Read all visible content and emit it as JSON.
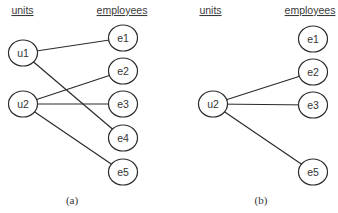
{
  "colors": {
    "stroke": "#2b2b2b",
    "text": "#333333",
    "background": "#ffffff"
  },
  "panels": [
    {
      "id": "a",
      "caption": "(a)",
      "caption_pos": [
        72,
        204
      ],
      "headers": {
        "units": {
          "label": "units",
          "x": 22.5,
          "y": 14
        },
        "employees": {
          "label": "employees",
          "x": 122,
          "y": 14
        }
      },
      "nodes": [
        {
          "id": "u1",
          "label": "u1",
          "type": "unit",
          "x": 23,
          "y": 53
        },
        {
          "id": "u2",
          "label": "u2",
          "type": "unit",
          "x": 23,
          "y": 104
        },
        {
          "id": "e1",
          "label": "e1",
          "type": "employee",
          "x": 123,
          "y": 38
        },
        {
          "id": "e2",
          "label": "e2",
          "type": "employee",
          "x": 123,
          "y": 71
        },
        {
          "id": "e3",
          "label": "e3",
          "type": "employee",
          "x": 123,
          "y": 104
        },
        {
          "id": "e4",
          "label": "e4",
          "type": "employee",
          "x": 123,
          "y": 138
        },
        {
          "id": "e5",
          "label": "e5",
          "type": "employee",
          "x": 123,
          "y": 172
        }
      ],
      "edges": [
        [
          "u1",
          "e1"
        ],
        [
          "u1",
          "e4"
        ],
        [
          "u2",
          "e2"
        ],
        [
          "u2",
          "e3"
        ],
        [
          "u2",
          "e5"
        ]
      ]
    },
    {
      "id": "b",
      "caption": "(b)",
      "caption_pos": [
        261,
        204
      ],
      "headers": {
        "units": {
          "label": "units",
          "x": 210.5,
          "y": 14
        },
        "employees": {
          "label": "employees",
          "x": 310,
          "y": 14
        }
      },
      "nodes": [
        {
          "id": "u2",
          "label": "u2",
          "type": "unit",
          "x": 213,
          "y": 104
        },
        {
          "id": "e1",
          "label": "e1",
          "type": "employee",
          "x": 313,
          "y": 39
        },
        {
          "id": "e2",
          "label": "e2",
          "type": "employee",
          "x": 313,
          "y": 72
        },
        {
          "id": "e3",
          "label": "e3",
          "type": "employee",
          "x": 313,
          "y": 105
        },
        {
          "id": "e5",
          "label": "e5",
          "type": "employee",
          "x": 313,
          "y": 172
        }
      ],
      "edges": [
        [
          "u2",
          "e2"
        ],
        [
          "u2",
          "e3"
        ],
        [
          "u2",
          "e5"
        ]
      ]
    }
  ]
}
